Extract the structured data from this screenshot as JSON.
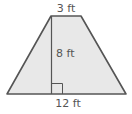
{
  "diagram": {
    "shape": "trapezoid",
    "labels": {
      "top_base": "3 ft",
      "height": "8 ft",
      "bottom_base": "12 ft"
    },
    "colors": {
      "fill": "#e8e8e8",
      "stroke": "#555555",
      "text": "#555555"
    }
  }
}
